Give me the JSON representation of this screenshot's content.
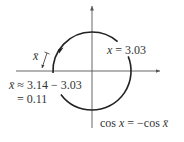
{
  "diagram": {
    "type": "unit-circle-angle",
    "colors": {
      "axis": "#555555",
      "arc": "#222222",
      "text": "#333333",
      "background": "#ffffff"
    },
    "axes": {
      "horizontal": true,
      "vertical": true,
      "arrowheads": [
        "right",
        "up"
      ]
    },
    "arc": {
      "direction": "counterclockwise",
      "arrow_icon": "arrowhead-icon"
    }
  },
  "labels": {
    "x_value": {
      "var": "x",
      "rest": " = 3.03"
    },
    "xbar_marker": {
      "var": "x̄"
    },
    "xbar_calc_line1": {
      "var": "x̄",
      "rest": " ≈ 3.14 − 3.03"
    },
    "xbar_calc_line2": "= 0.11",
    "cos_relation": {
      "lhs": "cos ",
      "lhs_var": "x",
      "mid": " = −cos ",
      "rhs_var": "x̄"
    }
  }
}
